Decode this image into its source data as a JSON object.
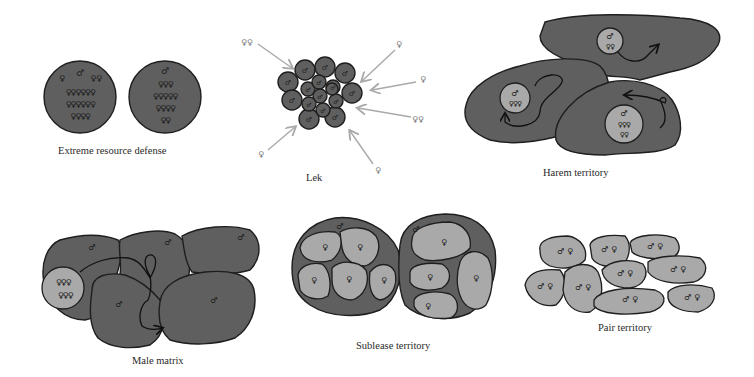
{
  "figure": {
    "panels": [
      {
        "id": "extreme-resource-defense",
        "label": "Extreme resource defense"
      },
      {
        "id": "lek",
        "label": "Lek"
      },
      {
        "id": "harem-territory",
        "label": "Harem territory"
      },
      {
        "id": "male-matrix",
        "label": "Male matrix"
      },
      {
        "id": "sublease-territory",
        "label": "Sublease territory"
      },
      {
        "id": "pair-territory",
        "label": "Pair territory"
      }
    ],
    "symbols": {
      "male": "♂",
      "female": "♀"
    },
    "colors": {
      "territory_dark": "#5f5f5f",
      "territory_light": "#a9a9a9",
      "outline": "#1e1e1e",
      "arrow_gray": "#a9a9a9",
      "background": "#ffffff"
    },
    "extreme_resource_defense": {
      "circles": [
        {
          "male": "♂",
          "female_rows": [
            "♀",
            "♀♀",
            "♀♀♀♀♀♀",
            "♀♀♀♀♀♀",
            "♀♀♀♀"
          ]
        },
        {
          "male": "♂",
          "female_rows": [
            "♀♀♀",
            "♀♀♀♀♀",
            "♀♀♀♀",
            "♀♀"
          ]
        }
      ]
    },
    "lek": {
      "female_groups": [
        "♀♀",
        "♀",
        "♀",
        "♀♀",
        "♀",
        "♀"
      ]
    },
    "harem": {
      "groups": [
        {
          "male": "♂",
          "females": "♀♀"
        },
        {
          "male": "♂",
          "females": "♀♀♀"
        },
        {
          "male": "♂",
          "females_rows": [
            "♀♀♀",
            "♀♀"
          ]
        }
      ]
    },
    "male_matrix": {
      "female_rows": [
        "♀♀♀",
        "♀♀♀"
      ]
    },
    "pair_territory": {
      "pair": "♂ ♀"
    }
  }
}
